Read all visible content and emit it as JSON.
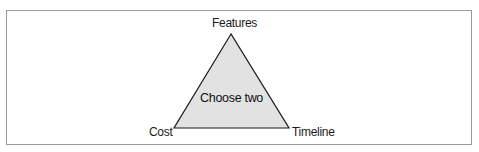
{
  "diagram": {
    "type": "triangle",
    "vertices": {
      "top": "Features",
      "bottom_left": "Cost",
      "bottom_right": "Timeline"
    },
    "center_label": "Choose two",
    "colors": {
      "fill": "#e2e2e2",
      "stroke": "#1a1a1a",
      "frame_border": "#9a9a9a"
    }
  }
}
